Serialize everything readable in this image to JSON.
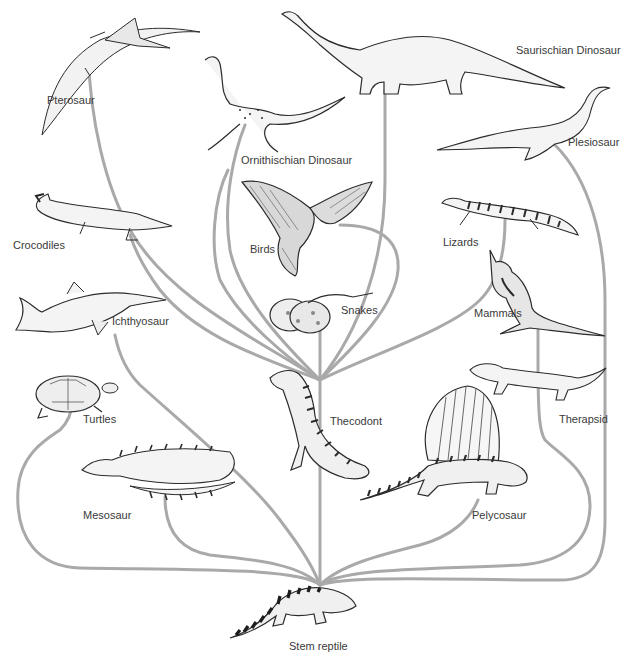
{
  "diagram": {
    "type": "phylogenetic-tree",
    "root": "Stem reptile",
    "hub": "Thecodont",
    "line_color": "#a8a8a8",
    "ink_color": "#2b2b2b",
    "labels": {
      "pterosaur": "Pterosaur",
      "ornithischian": "Ornithischian Dinosaur",
      "saurischian": "Saurischian Dinosaur",
      "plesiosaur": "Plesiosaur",
      "crocodiles": "Crocodiles",
      "birds": "Birds",
      "lizards": "Lizards",
      "ichthyosaur": "Ichthyosaur",
      "snakes": "Snakes",
      "mammals": "Mammals",
      "turtles": "Turtles",
      "thecodont": "Thecodont",
      "therapsid": "Therapsid",
      "mesosaur": "Mesosaur",
      "pelycosaur": "Pelycosaur",
      "stem_reptile": "Stem reptile"
    },
    "edges": [
      {
        "from": "Stem reptile",
        "to": "Turtles"
      },
      {
        "from": "Stem reptile",
        "to": "Mesosaur"
      },
      {
        "from": "Stem reptile",
        "to": "Thecodont"
      },
      {
        "from": "Stem reptile",
        "to": "Pelycosaur"
      },
      {
        "from": "Stem reptile",
        "to": "Therapsid"
      },
      {
        "from": "Stem reptile",
        "to": "Plesiosaur"
      },
      {
        "from": "Stem reptile",
        "to": "Ichthyosaur"
      },
      {
        "from": "Thecodont",
        "to": "Pterosaur"
      },
      {
        "from": "Thecodont",
        "to": "Ornithischian Dinosaur"
      },
      {
        "from": "Thecodont",
        "to": "Saurischian Dinosaur"
      },
      {
        "from": "Thecodont",
        "to": "Crocodiles"
      },
      {
        "from": "Thecodont",
        "to": "Birds"
      },
      {
        "from": "Thecodont",
        "to": "Snakes"
      },
      {
        "from": "Thecodont",
        "to": "Lizards"
      },
      {
        "from": "Therapsid",
        "to": "Mammals"
      }
    ]
  }
}
